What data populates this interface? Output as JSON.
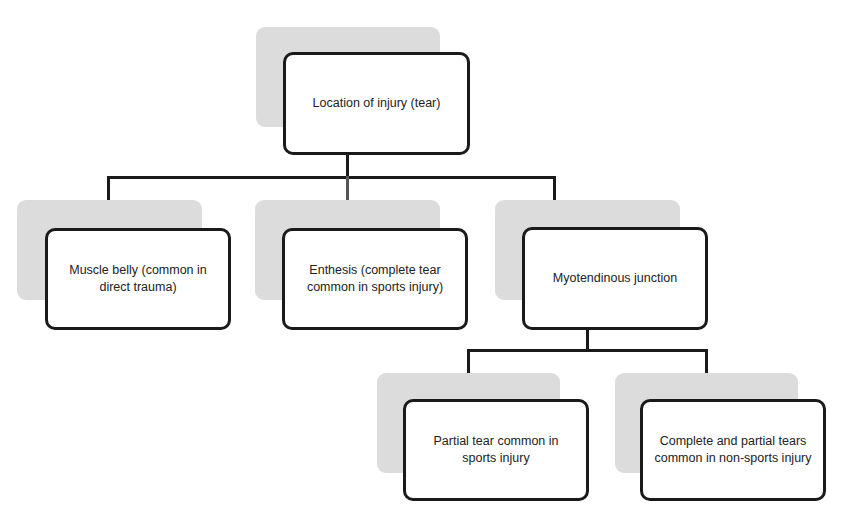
{
  "diagram": {
    "type": "tree",
    "root": {
      "label": "Location of injury (tear)"
    },
    "level1": [
      {
        "label": "Muscle belly (common in direct trauma)"
      },
      {
        "label": "Enthesis (complete tear common in sports injury)"
      },
      {
        "label": "Myotendinous junction"
      }
    ],
    "level2_under_myotendinous_junction": [
      {
        "label": "Partial tear common in sports injury"
      },
      {
        "label": "Complete and partial tears common in non-sports injury"
      }
    ],
    "colors": {
      "node_border": "#1a1a1a",
      "node_fill": "#ffffff",
      "shadow_fill": "#dcdcdc",
      "connector": "#1a1a1a"
    }
  }
}
